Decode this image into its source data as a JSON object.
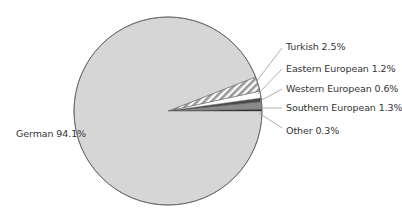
{
  "chart_data": {
    "type": "pie",
    "title": "",
    "start_angle_deg": 0,
    "direction": "counterclockwise",
    "legend": "none (direct labels with leader lines)",
    "slices": [
      {
        "label": "Other",
        "value": 0.3,
        "display": "Other 0.3%",
        "fill": "#151515",
        "pattern": "solid"
      },
      {
        "label": "Southern European",
        "value": 1.3,
        "display": "Southern European 1.3%",
        "fill": "#8a8a8a",
        "pattern": "solid"
      },
      {
        "label": "Western European",
        "value": 0.6,
        "display": "Western European 0.6%",
        "fill": "#4a4a4a",
        "pattern": "solid"
      },
      {
        "label": "Eastern European",
        "value": 1.2,
        "display": "Eastern European 1.2%",
        "fill": "#ffffff",
        "pattern": "solid"
      },
      {
        "label": "Turkish",
        "value": 2.5,
        "display": "Turkish 2.5%",
        "fill": "#9a9a9a",
        "pattern": "diagonal-hatch"
      },
      {
        "label": "German",
        "value": 94.1,
        "display": "German 94.1%",
        "fill": "#d6d6d6",
        "pattern": "solid"
      }
    ],
    "categories": [
      "German",
      "Turkish",
      "Eastern European",
      "Western European",
      "Southern European",
      "Other"
    ],
    "values": [
      94.1,
      2.5,
      1.2,
      0.6,
      1.3,
      0.3
    ],
    "unit": "%"
  },
  "layout": {
    "cx": 168,
    "cy": 111,
    "r": 94,
    "outline": "#6a6a6a",
    "leader": "#9a9a9a"
  },
  "labels": [
    {
      "key": "Turkish",
      "text": "Turkish 2.5%",
      "x": 286,
      "y": 41,
      "line": [
        282,
        48,
        256,
        82
      ]
    },
    {
      "key": "Eastern European",
      "text": "Eastern European 1.2%",
      "x": 286,
      "y": 63,
      "line": [
        282,
        69,
        258,
        94
      ]
    },
    {
      "key": "Western European",
      "text": "Western European 0.6%",
      "x": 286,
      "y": 83,
      "line": [
        282,
        89,
        260,
        101
      ]
    },
    {
      "key": "Southern European",
      "text": "Southern European 1.3%",
      "x": 286,
      "y": 102,
      "line": [
        282,
        108,
        261,
        108
      ]
    },
    {
      "key": "Other",
      "text": "Other 0.3%",
      "x": 286,
      "y": 125,
      "line": [
        282,
        128,
        259,
        113
      ]
    },
    {
      "key": "German",
      "text": "German 94.1%",
      "x": 16,
      "y": 128,
      "line": null
    }
  ]
}
